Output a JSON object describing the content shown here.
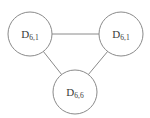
{
  "diagram": {
    "type": "undirected-graph",
    "title": "",
    "canvas": {
      "width": 150,
      "height": 118,
      "background": "#ffffff"
    },
    "style": {
      "stroke_color": "#8a8a8a",
      "node_fill": "#ffffff",
      "label_color": "#3a3a3a",
      "stroke_width": 1
    },
    "nodes": [
      {
        "id": "n1",
        "name": "node-top-left",
        "label_base": "D",
        "label_sub": "6,1",
        "label_full": "D6,1",
        "cx": 30,
        "cy": 34,
        "r": 22
      },
      {
        "id": "n2",
        "name": "node-top-right",
        "label_base": "D",
        "label_sub": "6,1",
        "label_full": "D6,1",
        "cx": 121,
        "cy": 34,
        "r": 22
      },
      {
        "id": "n3",
        "name": "node-bottom",
        "label_base": "D",
        "label_sub": "6,6",
        "label_full": "D6,6",
        "cx": 75,
        "cy": 92,
        "r": 22
      }
    ],
    "edges": [
      {
        "id": "e1",
        "name": "edge-top-left-to-top-right",
        "from": "n1",
        "to": "n2",
        "x1": 52,
        "y1": 34,
        "x2": 99,
        "y2": 34
      },
      {
        "id": "e2",
        "name": "edge-top-left-to-bottom",
        "from": "n1",
        "to": "n3",
        "x1": 43,
        "y1": 51,
        "x2": 62,
        "y2": 75
      },
      {
        "id": "e3",
        "name": "edge-top-right-to-bottom",
        "from": "n2",
        "to": "n3",
        "x1": 108,
        "y1": 51,
        "x2": 88,
        "y2": 75
      }
    ]
  }
}
